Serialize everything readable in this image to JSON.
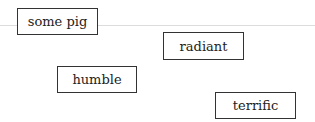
{
  "words": [
    {
      "label": "some pig",
      "x": 17,
      "y": 8,
      "w": 81,
      "h": 27
    },
    {
      "label": "radiant",
      "x": 163,
      "y": 32,
      "w": 81,
      "h": 28
    },
    {
      "label": "humble",
      "x": 57,
      "y": 66,
      "w": 80,
      "h": 27
    },
    {
      "label": "terrific",
      "x": 215,
      "y": 92,
      "w": 81,
      "h": 27
    }
  ],
  "colors": {
    "border": "#333333",
    "line": "#dcdcdc",
    "text": "#222222"
  }
}
